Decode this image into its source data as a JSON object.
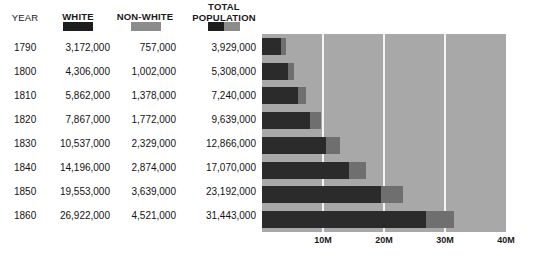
{
  "header": {
    "year_label": "YEAR",
    "white_label": "WHITE",
    "nonwhite_label": "NON-WHITE",
    "total_label": "TOTAL POPULATION",
    "total_label_line1": "TOTAL",
    "total_label_line2": "POPULATION"
  },
  "colors": {
    "white_series": "#2b2b2b",
    "nonwhite_series": "#6f6f6f",
    "plot_background": "#a8a8a8",
    "gridline": "#f4f4f4",
    "page_background": "#ffffff"
  },
  "table": {
    "columns": [
      "YEAR",
      "WHITE",
      "NON-WHITE",
      "TOTAL POPULATION"
    ],
    "rows": [
      {
        "year": "1790",
        "white": "3,172,000",
        "nonwhite": "757,000",
        "total": "3,929,000"
      },
      {
        "year": "1800",
        "white": "4,306,000",
        "nonwhite": "1,002,000",
        "total": "5,308,000"
      },
      {
        "year": "1810",
        "white": "5,862,000",
        "nonwhite": "1,378,000",
        "total": "7,240,000"
      },
      {
        "year": "1820",
        "white": "7,867,000",
        "nonwhite": "1,772,000",
        "total": "9,639,000"
      },
      {
        "year": "1830",
        "white": "10,537,000",
        "nonwhite": "2,329,000",
        "total": "12,866,000"
      },
      {
        "year": "1840",
        "white": "14,196,000",
        "nonwhite": "2,874,000",
        "total": "17,070,000"
      },
      {
        "year": "1850",
        "white": "19,553,000",
        "nonwhite": "3,639,000",
        "total": "23,192,000"
      },
      {
        "year": "1860",
        "white": "26,922,000",
        "nonwhite": "4,521,000",
        "total": "31,443,000"
      }
    ]
  },
  "chart_data": {
    "type": "bar",
    "orientation": "horizontal",
    "stacked": true,
    "title": "",
    "xlabel": "",
    "ylabel": "",
    "categories": [
      "1790",
      "1800",
      "1810",
      "1820",
      "1830",
      "1840",
      "1850",
      "1860"
    ],
    "series": [
      {
        "name": "WHITE",
        "color": "#2b2b2b",
        "values": [
          3172000,
          4306000,
          5862000,
          7867000,
          10537000,
          14196000,
          19553000,
          26922000
        ]
      },
      {
        "name": "NON-WHITE",
        "color": "#6f6f6f",
        "values": [
          757000,
          1002000,
          1378000,
          1772000,
          2329000,
          2874000,
          3639000,
          4521000
        ]
      }
    ],
    "totals": [
      3929000,
      5308000,
      7240000,
      9639000,
      12866000,
      17070000,
      23192000,
      31443000
    ],
    "xlim": [
      0,
      40000000
    ],
    "xticks": [
      10000000,
      20000000,
      30000000,
      40000000
    ],
    "xtick_labels": [
      "10M",
      "20M",
      "30M",
      "40M"
    ],
    "grid": true,
    "legend_position": "top"
  }
}
